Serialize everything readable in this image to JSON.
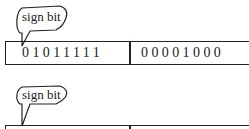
{
  "diagrams": [
    {
      "callout": {
        "label": "sign bit"
      },
      "register": {
        "high_byte": "01011111",
        "low_byte": "00001000"
      }
    },
    {
      "callout": {
        "label": "sign bit"
      },
      "register": {
        "high_byte": "",
        "low_byte": ""
      }
    }
  ]
}
